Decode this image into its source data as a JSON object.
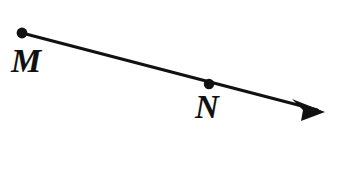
{
  "figure": {
    "kind": "geometry-ray-diagram",
    "width": 346,
    "height": 170,
    "background_color": "#ffffff",
    "stroke_color": "#111111",
    "line_width": 3.2
  },
  "points": [
    {
      "id": "M",
      "label": "M",
      "role": "ray-endpoint",
      "dot_x": 22,
      "dot_y": 33,
      "dot_radius": 5.4,
      "label_x": 11,
      "label_y": 44
    },
    {
      "id": "N",
      "label": "N",
      "role": "point-on-ray",
      "dot_x": 209,
      "dot_y": 84,
      "dot_radius": 5.2,
      "label_x": 195,
      "label_y": 91
    }
  ],
  "ray": {
    "start_x": 22,
    "start_y": 33,
    "end_x": 325,
    "end_y": 112,
    "slope": 0.26,
    "arrowhead": {
      "tip_x": 325,
      "tip_y": 112,
      "back_top_x": 292,
      "back_top_y": 99,
      "back_bottom_x": 301,
      "back_bottom_y": 121,
      "notch_x": 303,
      "notch_y": 110
    }
  }
}
